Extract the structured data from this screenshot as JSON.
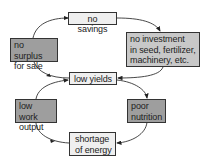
{
  "diagram": {
    "type": "cycle",
    "nodes": [
      {
        "id": "no_savings",
        "label": "no savings",
        "shade": "light"
      },
      {
        "id": "no_investment",
        "label_lines": [
          "no investment",
          "in seed, fertilizer,",
          "machinery, etc."
        ],
        "shade": "mid"
      },
      {
        "id": "low_yields",
        "label": "low yields",
        "shade": "light"
      },
      {
        "id": "no_surplus",
        "label_lines": [
          "no surplus",
          "for sale"
        ],
        "shade": "dark"
      },
      {
        "id": "poor_nutrition",
        "label_lines": [
          "poor",
          "nutrition"
        ],
        "shade": "dark"
      },
      {
        "id": "shortage_energy",
        "label_lines": [
          "shortage",
          "of energy"
        ],
        "shade": "light"
      },
      {
        "id": "low_work_output",
        "label_lines": [
          "low work",
          "output"
        ],
        "shade": "dark"
      }
    ],
    "edges": [
      [
        "no_savings",
        "no_investment"
      ],
      [
        "no_investment",
        "low_yields"
      ],
      [
        "low_yields",
        "no_surplus"
      ],
      [
        "no_surplus",
        "no_savings"
      ],
      [
        "low_yields",
        "poor_nutrition"
      ],
      [
        "poor_nutrition",
        "shortage_energy"
      ],
      [
        "shortage_energy",
        "low_work_output"
      ],
      [
        "low_work_output",
        "low_yields"
      ]
    ],
    "colors": {
      "light": "#efefef",
      "mid": "#c8c8c8",
      "dark": "#9e9e9e",
      "stroke": "#333333"
    }
  }
}
